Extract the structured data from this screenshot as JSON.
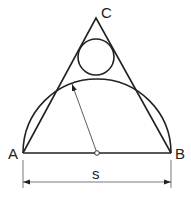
{
  "diagram": {
    "points": {
      "A": {
        "label": "A",
        "x": 23,
        "y": 153
      },
      "B": {
        "label": "B",
        "x": 171,
        "y": 153
      },
      "C": {
        "label": "C",
        "x": 96,
        "y": 18
      }
    },
    "semicircle": {
      "cx": 97,
      "cy": 153,
      "r": 74
    },
    "incircle": {
      "cx": 96,
      "cy": 57,
      "r": 18
    },
    "radius_arrow": {
      "from": [
        97,
        153
      ],
      "to": [
        72,
        84
      ]
    },
    "dimension": {
      "label": "s",
      "y": 182
    }
  },
  "colors": {
    "stroke": "#222222",
    "background": "#ffffff"
  }
}
